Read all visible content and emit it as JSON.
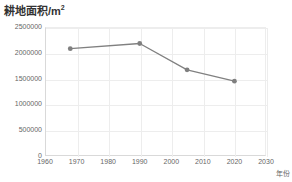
{
  "chart_data": {
    "type": "line",
    "title_main": "耕地面积/m",
    "title_sup": "2",
    "xlabel": "年份",
    "ylabel": "",
    "xlim": [
      1960,
      2030
    ],
    "ylim": [
      0,
      2500000
    ],
    "grid": true,
    "legend": "none",
    "xticks": [
      1960,
      1970,
      1980,
      1990,
      2000,
      2010,
      2020,
      2030
    ],
    "xtick_labels": [
      "1960",
      "1970",
      "1980",
      "1990",
      "2000",
      "2010",
      "2020",
      "2030"
    ],
    "yticks": [
      0,
      500000,
      1000000,
      1500000,
      2000000,
      2500000
    ],
    "ytick_labels": [
      "0",
      "500000",
      "1000000",
      "1500000",
      "2000000",
      "2500000"
    ],
    "x": [
      1968,
      1990,
      2005,
      2020
    ],
    "values": [
      2080000,
      2180000,
      1670000,
      1450000
    ],
    "points": [
      {
        "x": 1968,
        "y": 2080000
      },
      {
        "x": 1990,
        "y": 2180000
      },
      {
        "x": 2005,
        "y": 1670000
      },
      {
        "x": 2020,
        "y": 1450000
      }
    ],
    "series_name": "耕地面积",
    "line_color": "#808080",
    "marker_color": "#7f7f7f",
    "grid_color": "#ededed",
    "axis_color": "#d9d9d9",
    "text_color": "#666666",
    "title_color": "#333333",
    "background": "#ffffff"
  }
}
